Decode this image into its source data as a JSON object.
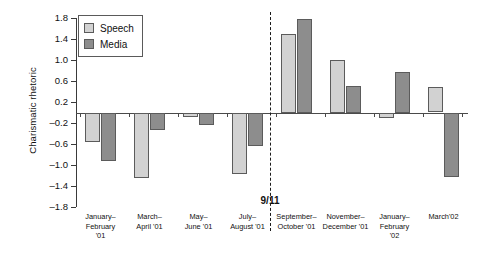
{
  "chart_data": {
    "type": "bar",
    "title": "",
    "subtitle": "",
    "xlabel": "",
    "ylabel": "Charismatic rhetoric",
    "ylim": [
      -1.8,
      1.8
    ],
    "yticks": [
      1.8,
      1.4,
      1.0,
      0.6,
      0.2,
      -0.2,
      -0.6,
      -1.0,
      -1.4,
      -1.8
    ],
    "ytick_labels": [
      "1.8",
      "1.4",
      "1.0",
      "0.6",
      "0.2",
      "–0.2",
      "–0.6",
      "–1.0",
      "–1.4",
      "–1.8"
    ],
    "grid": false,
    "legend_position": "top-left",
    "categories": [
      "January–\nFebruary\n'01",
      "March–\nApril '01",
      "May–\nJune '01",
      "July–\nAugust '01",
      "September–\nOctober '01",
      "November–\nDecember '01",
      "January–\nFebruary\n'02",
      "March'02"
    ],
    "series": [
      {
        "name": "Speech",
        "color": "#d2d2d2",
        "values": [
          -0.56,
          -1.25,
          -0.08,
          -1.18,
          1.5,
          1.0,
          -0.1,
          0.48
        ]
      },
      {
        "name": "Media",
        "color": "#8d8d8d",
        "values": [
          -0.93,
          -0.33,
          -0.24,
          -0.63,
          1.78,
          0.5,
          0.78,
          -1.22
        ]
      }
    ],
    "annotations": [
      {
        "name": "9/11",
        "label": "9/11",
        "type": "vertical-dashed-line",
        "after_category_index": 3
      }
    ]
  }
}
